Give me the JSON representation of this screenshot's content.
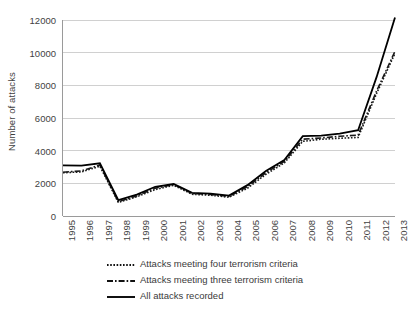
{
  "chart_data": {
    "type": "line",
    "title": "",
    "xlabel": "",
    "ylabel": "Number of attacks",
    "ylim": [
      0,
      12000
    ],
    "y_ticks": [
      0,
      2000,
      4000,
      6000,
      8000,
      10000,
      12000
    ],
    "y_tick_labels": [
      "0",
      "2000",
      "4000",
      "6000",
      "8000",
      "10000",
      "12000"
    ],
    "grid": true,
    "grid_axis": "y",
    "legend_position": "bottom",
    "categories": [
      "1995",
      "1996",
      "1997",
      "1998",
      "1999",
      "2000",
      "2001",
      "2002",
      "2003",
      "2004",
      "2005",
      "2006",
      "2007",
      "2008",
      "2009",
      "2010",
      "2011",
      "2012",
      "2013"
    ],
    "x": [
      1995,
      1996,
      1997,
      1998,
      1999,
      2000,
      2001,
      2002,
      2003,
      2004,
      2005,
      2006,
      2007,
      2008,
      2009,
      2010,
      2011,
      2012,
      2013
    ],
    "series": [
      {
        "name": "Attacks meeting four terrorism criteria",
        "style": "dotted",
        "color": "#1a1a1a",
        "values": [
          2650,
          2700,
          3050,
          830,
          1180,
          1620,
          1880,
          1330,
          1270,
          1150,
          1700,
          2550,
          3250,
          4570,
          4700,
          4760,
          4810,
          7500,
          9960
        ]
      },
      {
        "name": "Attacks meeting three terrorism criteria",
        "style": "dash-dot",
        "color": "#1a1a1a",
        "values": [
          2680,
          2760,
          3120,
          870,
          1230,
          1700,
          1930,
          1380,
          1320,
          1200,
          1790,
          2650,
          3340,
          4700,
          4780,
          4880,
          4950,
          7650,
          10080
        ]
      },
      {
        "name": "All attacks recorded",
        "style": "solid",
        "color": "#000000",
        "values": [
          3100,
          3090,
          3230,
          970,
          1310,
          1790,
          1960,
          1420,
          1370,
          1250,
          1890,
          2760,
          3430,
          4890,
          4920,
          5050,
          5250,
          8500,
          12150
        ]
      }
    ]
  },
  "axes": {
    "y_title": "Number of attacks"
  },
  "legend": {
    "items": [
      {
        "label": "Attacks meeting four terrorism criteria",
        "style": "dotted"
      },
      {
        "label": "Attacks meeting three terrorism criteria",
        "style": "dash-dot"
      },
      {
        "label": "All attacks recorded",
        "style": "solid"
      }
    ]
  },
  "colors": {
    "line": "#111111",
    "grid": "#d0d0d0",
    "axis": "#9a9a9a",
    "text": "#3f3f3f",
    "background": "#ffffff"
  }
}
